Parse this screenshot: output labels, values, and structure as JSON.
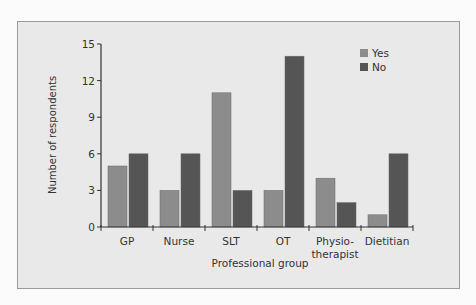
{
  "chart_data": {
    "type": "bar",
    "title": "",
    "xlabel": "Professional group",
    "ylabel": "Number of respondents",
    "categories": [
      "GP",
      "Nurse",
      "SLT",
      "OT",
      "Physio-therapist",
      "Dietitian"
    ],
    "category_lines": [
      [
        "GP"
      ],
      [
        "Nurse"
      ],
      [
        "SLT"
      ],
      [
        "OT"
      ],
      [
        "Physio-",
        "therapist"
      ],
      [
        "Dietitian"
      ]
    ],
    "series": [
      {
        "name": "Yes",
        "color": "#8c8c8c",
        "values": [
          5,
          3,
          11,
          3,
          4,
          1
        ]
      },
      {
        "name": "No",
        "color": "#555555",
        "values": [
          6,
          6,
          3,
          14,
          2,
          6
        ]
      }
    ],
    "ylim": [
      0,
      15
    ],
    "yticks": [
      0,
      3,
      6,
      9,
      12,
      15
    ],
    "grid": false,
    "legend_position": "top-right"
  }
}
